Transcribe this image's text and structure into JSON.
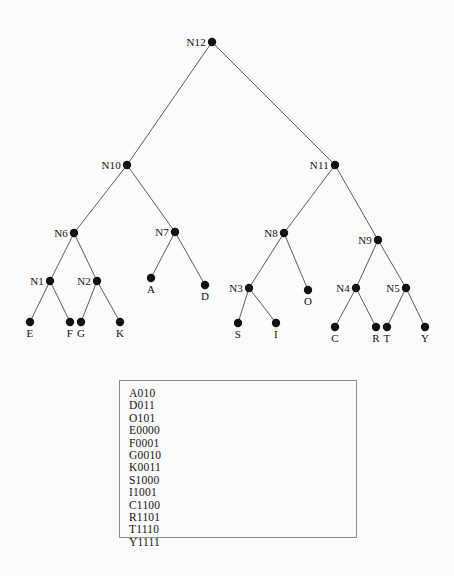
{
  "diagram": {
    "type": "huffman-tree",
    "title": "",
    "node_radius": 4.2,
    "edge_color": "#4a4a4a",
    "node_color": "#121212",
    "background": "#fbfbfb",
    "nodes": [
      {
        "id": "N12",
        "label": "N12",
        "x": 212,
        "y": 42,
        "label_pos": "left",
        "kind": "internal"
      },
      {
        "id": "N10",
        "label": "N10",
        "x": 127,
        "y": 165,
        "label_pos": "left",
        "kind": "internal"
      },
      {
        "id": "N11",
        "label": "N11",
        "x": 335,
        "y": 165,
        "label_pos": "left",
        "kind": "internal"
      },
      {
        "id": "N6",
        "label": "N6",
        "x": 74,
        "y": 233,
        "label_pos": "left",
        "kind": "internal"
      },
      {
        "id": "N7",
        "label": "N7",
        "x": 175,
        "y": 232,
        "label_pos": "left",
        "kind": "internal"
      },
      {
        "id": "N8",
        "label": "N8",
        "x": 284,
        "y": 233,
        "label_pos": "left",
        "kind": "internal"
      },
      {
        "id": "N9",
        "label": "N9",
        "x": 378,
        "y": 240,
        "label_pos": "left",
        "kind": "internal"
      },
      {
        "id": "N1",
        "label": "N1",
        "x": 50,
        "y": 281,
        "label_pos": "left",
        "kind": "internal"
      },
      {
        "id": "N2",
        "label": "N2",
        "x": 97,
        "y": 281,
        "label_pos": "left",
        "kind": "internal"
      },
      {
        "id": "N3",
        "label": "N3",
        "x": 249,
        "y": 288,
        "label_pos": "left",
        "kind": "internal"
      },
      {
        "id": "N4",
        "label": "N4",
        "x": 356,
        "y": 288,
        "label_pos": "left",
        "kind": "internal"
      },
      {
        "id": "N5",
        "label": "N5",
        "x": 406,
        "y": 288,
        "label_pos": "left",
        "kind": "internal"
      },
      {
        "id": "A",
        "label": "A",
        "x": 151,
        "y": 278,
        "label_pos": "below",
        "kind": "leaf"
      },
      {
        "id": "D",
        "label": "D",
        "x": 205,
        "y": 285,
        "label_pos": "below",
        "kind": "leaf"
      },
      {
        "id": "O",
        "label": "O",
        "x": 308,
        "y": 290,
        "label_pos": "below",
        "kind": "leaf"
      },
      {
        "id": "E",
        "label": "E",
        "x": 30,
        "y": 322,
        "label_pos": "below",
        "kind": "leaf"
      },
      {
        "id": "F",
        "label": "F",
        "x": 70,
        "y": 322,
        "label_pos": "below",
        "kind": "leaf"
      },
      {
        "id": "G",
        "label": "G",
        "x": 81,
        "y": 322,
        "label_pos": "below",
        "kind": "leaf"
      },
      {
        "id": "K",
        "label": "K",
        "x": 120,
        "y": 322,
        "label_pos": "below",
        "kind": "leaf"
      },
      {
        "id": "S",
        "label": "S",
        "x": 238,
        "y": 323,
        "label_pos": "below",
        "kind": "leaf"
      },
      {
        "id": "I",
        "label": "I",
        "x": 276,
        "y": 323,
        "label_pos": "below",
        "kind": "leaf"
      },
      {
        "id": "C",
        "label": "C",
        "x": 335,
        "y": 327,
        "label_pos": "below",
        "kind": "leaf"
      },
      {
        "id": "R",
        "label": "R",
        "x": 376,
        "y": 327,
        "label_pos": "below",
        "kind": "leaf"
      },
      {
        "id": "T",
        "label": "T",
        "x": 387,
        "y": 327,
        "label_pos": "below",
        "kind": "leaf"
      },
      {
        "id": "Y",
        "label": "Y",
        "x": 425,
        "y": 327,
        "label_pos": "below",
        "kind": "leaf"
      }
    ],
    "edges": [
      {
        "from": "N12",
        "to": "N10"
      },
      {
        "from": "N12",
        "to": "N11"
      },
      {
        "from": "N10",
        "to": "N6"
      },
      {
        "from": "N10",
        "to": "N7"
      },
      {
        "from": "N11",
        "to": "N8"
      },
      {
        "from": "N11",
        "to": "N9"
      },
      {
        "from": "N6",
        "to": "N1"
      },
      {
        "from": "N6",
        "to": "N2"
      },
      {
        "from": "N7",
        "to": "A"
      },
      {
        "from": "N7",
        "to": "D"
      },
      {
        "from": "N8",
        "to": "N3"
      },
      {
        "from": "N8",
        "to": "O"
      },
      {
        "from": "N9",
        "to": "N4"
      },
      {
        "from": "N9",
        "to": "N5"
      },
      {
        "from": "N1",
        "to": "E"
      },
      {
        "from": "N1",
        "to": "F"
      },
      {
        "from": "N2",
        "to": "G"
      },
      {
        "from": "N2",
        "to": "K"
      },
      {
        "from": "N3",
        "to": "S"
      },
      {
        "from": "N3",
        "to": "I"
      },
      {
        "from": "N4",
        "to": "C"
      },
      {
        "from": "N4",
        "to": "R"
      },
      {
        "from": "N5",
        "to": "T"
      },
      {
        "from": "N5",
        "to": "Y"
      }
    ]
  },
  "code_table": {
    "entries": [
      "A010",
      "D011",
      "O101",
      "E0000",
      "F0001",
      "G0010",
      "K0011",
      "S1000",
      "I1001",
      "C1100",
      "R1101",
      "T1110",
      "Y1111"
    ]
  },
  "page": {
    "bleed_text": ""
  }
}
